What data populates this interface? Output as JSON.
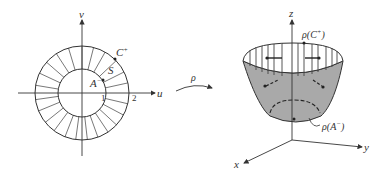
{
  "left_figure": {
    "axis_u_label": "u",
    "axis_v_label": "v",
    "tick_inner": "1",
    "tick_outer": "2",
    "outer_curve_label": "C",
    "outer_curve_sup": "+",
    "inner_curve_label": "A",
    "inner_curve_sup": "−",
    "region_label": "S"
  },
  "mapping": {
    "label": "ρ"
  },
  "right_figure": {
    "axis_x_label": "x",
    "axis_y_label": "y",
    "axis_z_label": "z",
    "top_curve_label": "ρ(C",
    "top_curve_sup": "+",
    "top_curve_close": ")",
    "bottom_curve_label": "ρ(A",
    "bottom_curve_sup": "−",
    "bottom_curve_close": ")",
    "surface_color": "#a9a9a9"
  }
}
